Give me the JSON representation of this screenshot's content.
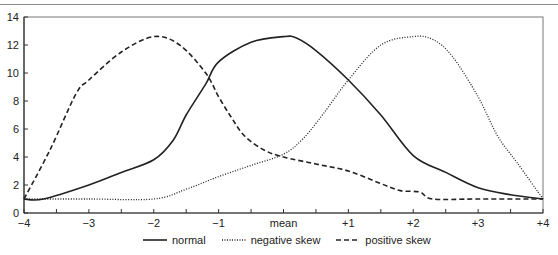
{
  "chart_data": {
    "type": "line",
    "title": "",
    "xlabel": "",
    "ylabel": "",
    "xlim": [
      -4,
      4
    ],
    "ylim": [
      0,
      14
    ],
    "grid": false,
    "legend_position": "bottom",
    "x_ticks": [
      -4,
      -3,
      -2,
      -1,
      0,
      1,
      2,
      3,
      4
    ],
    "x_tick_labels": [
      "−4",
      "−3",
      "−2",
      "−1",
      "mean",
      "+1",
      "+2",
      "+3",
      "+4"
    ],
    "y_ticks": [
      0,
      2,
      4,
      6,
      8,
      10,
      12,
      14
    ],
    "y_tick_labels": [
      "0",
      "2",
      "4",
      "6",
      "8",
      "10",
      "12",
      "14"
    ],
    "series": [
      {
        "name": "normal",
        "style": "solid",
        "color": "#222222",
        "points": [
          [
            -4,
            1
          ],
          [
            -3.7,
            1
          ],
          [
            -3,
            2
          ],
          [
            -2.5,
            2.9
          ],
          [
            -2,
            3.8
          ],
          [
            -1.7,
            5.2
          ],
          [
            -1.5,
            7
          ],
          [
            -1.2,
            9.2
          ],
          [
            -1,
            10.8
          ],
          [
            -0.5,
            12.2
          ],
          [
            0,
            12.6
          ],
          [
            0.2,
            12.5
          ],
          [
            0.5,
            11.6
          ],
          [
            1,
            9.5
          ],
          [
            1.5,
            7
          ],
          [
            2,
            4.1
          ],
          [
            2.5,
            2.9
          ],
          [
            3,
            1.8
          ],
          [
            3.5,
            1.3
          ],
          [
            4,
            1
          ]
        ]
      },
      {
        "name": "negative skew",
        "style": "dotted",
        "color": "#222222",
        "points": [
          [
            -4,
            1
          ],
          [
            -3,
            1
          ],
          [
            -2,
            1
          ],
          [
            -1.5,
            1.7
          ],
          [
            -1,
            2.6
          ],
          [
            -0.5,
            3.4
          ],
          [
            0,
            4.2
          ],
          [
            0.3,
            5.3
          ],
          [
            0.6,
            7
          ],
          [
            1,
            9.5
          ],
          [
            1.5,
            12
          ],
          [
            2,
            12.6
          ],
          [
            2.3,
            12.4
          ],
          [
            2.6,
            11.2
          ],
          [
            3,
            8.3
          ],
          [
            3.3,
            5.5
          ],
          [
            3.6,
            3.6
          ],
          [
            4,
            1
          ]
        ]
      },
      {
        "name": "positive skew",
        "style": "dashed",
        "color": "#222222",
        "points": [
          [
            -4,
            1
          ],
          [
            -3.6,
            4.5
          ],
          [
            -3.2,
            8.5
          ],
          [
            -3,
            9.5
          ],
          [
            -2.5,
            11.5
          ],
          [
            -2,
            12.6
          ],
          [
            -1.6,
            12
          ],
          [
            -1.2,
            10
          ],
          [
            -1,
            8.3
          ],
          [
            -0.8,
            6.8
          ],
          [
            -0.6,
            5.5
          ],
          [
            -0.3,
            4.5
          ],
          [
            0,
            4
          ],
          [
            0.5,
            3.5
          ],
          [
            1,
            3
          ],
          [
            1.5,
            2.1
          ],
          [
            1.8,
            1.6
          ],
          [
            2.1,
            1.5
          ],
          [
            2.3,
            1.0
          ],
          [
            3,
            1
          ],
          [
            4,
            1
          ]
        ]
      }
    ]
  },
  "legend": {
    "items": [
      {
        "label": "normal",
        "style": "solid"
      },
      {
        "label": "negative skew",
        "style": "dotted"
      },
      {
        "label": "positive skew",
        "style": "dashed"
      }
    ]
  }
}
